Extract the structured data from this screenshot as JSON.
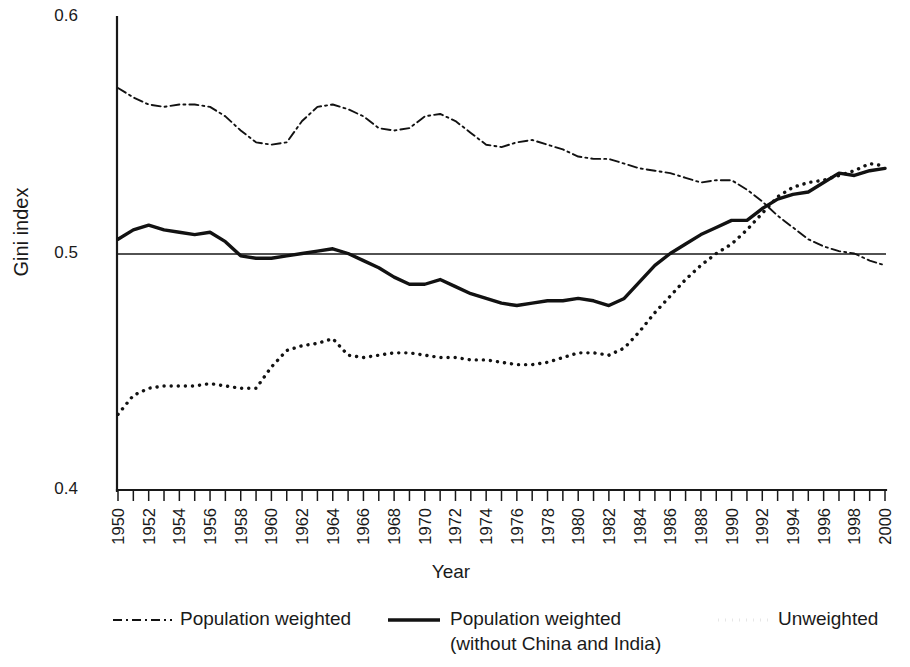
{
  "chart_data": {
    "type": "line",
    "title": "",
    "xlabel": "Year",
    "ylabel": "Gini index",
    "xlim": [
      1950,
      2000
    ],
    "ylim": [
      0.4,
      0.6
    ],
    "ytick_labels": [
      "0.6",
      "0.5",
      "0.4"
    ],
    "ytick_values": [
      0.6,
      0.5,
      0.4
    ],
    "grid": false,
    "reference_line": 0.5,
    "minor_tick_interval": 1,
    "major_tick_interval": 2,
    "legend_position": "bottom",
    "x": [
      1950,
      1951,
      1952,
      1953,
      1954,
      1955,
      1956,
      1957,
      1958,
      1959,
      1960,
      1961,
      1962,
      1963,
      1964,
      1965,
      1966,
      1967,
      1968,
      1969,
      1970,
      1971,
      1972,
      1973,
      1974,
      1975,
      1976,
      1977,
      1978,
      1979,
      1980,
      1981,
      1982,
      1983,
      1984,
      1985,
      1986,
      1987,
      1988,
      1989,
      1990,
      1991,
      1992,
      1993,
      1994,
      1995,
      1996,
      1997,
      1998,
      1999,
      2000
    ],
    "xtick_labels": [
      "1950",
      "1952",
      "1954",
      "1956",
      "1958",
      "1960",
      "1962",
      "1964",
      "1966",
      "1968",
      "1970",
      "1972",
      "1974",
      "1976",
      "1978",
      "1980",
      "1982",
      "1984",
      "1986",
      "1988",
      "1990",
      "1992",
      "1994",
      "1996",
      "1998",
      "2000"
    ],
    "series": [
      {
        "name": "Population weighted",
        "style": "dash-dot",
        "values": [
          0.57,
          0.566,
          0.563,
          0.562,
          0.563,
          0.563,
          0.562,
          0.558,
          0.552,
          0.547,
          0.546,
          0.547,
          0.556,
          0.562,
          0.563,
          0.561,
          0.558,
          0.553,
          0.552,
          0.553,
          0.558,
          0.559,
          0.556,
          0.551,
          0.546,
          0.545,
          0.547,
          0.548,
          0.546,
          0.544,
          0.541,
          0.54,
          0.54,
          0.538,
          0.536,
          0.535,
          0.534,
          0.532,
          0.53,
          0.531,
          0.531,
          0.527,
          0.522,
          0.516,
          0.511,
          0.506,
          0.503,
          0.501,
          0.5,
          0.497,
          0.495
        ]
      },
      {
        "name": "Population weighted (without China and India)",
        "style": "solid",
        "values": [
          0.506,
          0.51,
          0.512,
          0.51,
          0.509,
          0.508,
          0.509,
          0.505,
          0.499,
          0.498,
          0.498,
          0.499,
          0.5,
          0.501,
          0.502,
          0.5,
          0.497,
          0.494,
          0.49,
          0.487,
          0.487,
          0.489,
          0.486,
          0.483,
          0.481,
          0.479,
          0.478,
          0.479,
          0.48,
          0.48,
          0.481,
          0.48,
          0.478,
          0.481,
          0.488,
          0.495,
          0.5,
          0.504,
          0.508,
          0.511,
          0.514,
          0.514,
          0.519,
          0.523,
          0.525,
          0.526,
          0.53,
          0.534,
          0.533,
          0.535,
          0.536
        ]
      },
      {
        "name": "Unweighted",
        "style": "dotted",
        "values": [
          0.432,
          0.44,
          0.443,
          0.444,
          0.444,
          0.444,
          0.445,
          0.444,
          0.443,
          0.443,
          0.452,
          0.459,
          0.461,
          0.462,
          0.464,
          0.457,
          0.456,
          0.457,
          0.458,
          0.458,
          0.457,
          0.456,
          0.456,
          0.455,
          0.455,
          0.454,
          0.453,
          0.453,
          0.454,
          0.456,
          0.458,
          0.458,
          0.457,
          0.46,
          0.467,
          0.475,
          0.482,
          0.489,
          0.495,
          0.5,
          0.504,
          0.51,
          0.517,
          0.524,
          0.528,
          0.53,
          0.531,
          0.533,
          0.535,
          0.538,
          0.537
        ]
      }
    ]
  },
  "legend": {
    "items": [
      {
        "label": "Population weighted",
        "label2": "",
        "style": "dash-dot"
      },
      {
        "label": "Population weighted",
        "label2": "(without China and India)",
        "style": "solid"
      },
      {
        "label": "Unweighted",
        "label2": "",
        "style": "dotted"
      }
    ]
  },
  "colors": {
    "ink": "#121212",
    "background": "#ffffff"
  }
}
